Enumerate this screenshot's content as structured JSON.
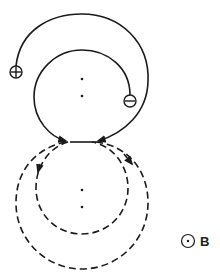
{
  "diagram": {
    "type": "charged-particle-trajectories-in-magnetic-field",
    "field_label": "B",
    "field_symbol": "out-of-page (dot in circle)",
    "charges": [
      {
        "sign": "+",
        "label": "positive-charge"
      },
      {
        "sign": "−",
        "label": "negative-charge"
      }
    ],
    "colors": {
      "stroke": "#1a1a1a",
      "background": "#ffffff"
    }
  }
}
